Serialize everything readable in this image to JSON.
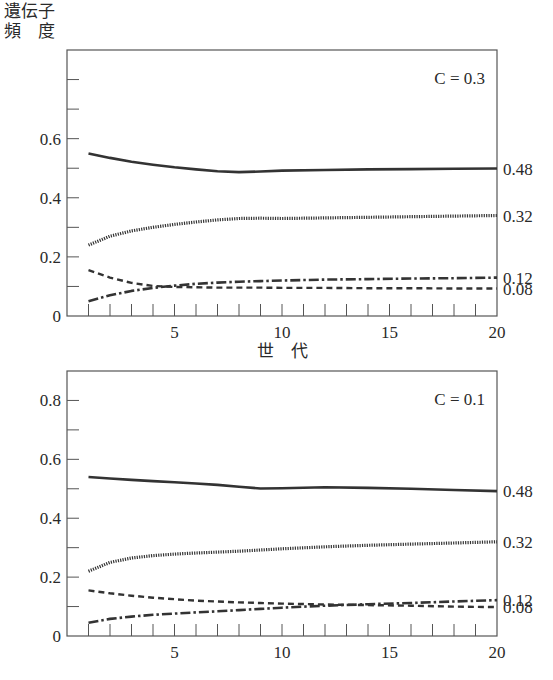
{
  "figure": {
    "ylabel_line1": "遺伝子",
    "ylabel_line2": "頻　度",
    "xlabel": "世　代"
  },
  "chart_data": [
    {
      "type": "line",
      "title": "C = 0.3",
      "xlabel": "世代",
      "ylabel": "遺伝子頻度",
      "xlim": [
        0,
        20
      ],
      "ylim": [
        0,
        0.9
      ],
      "x_ticks": [
        5,
        10,
        15,
        20
      ],
      "y_ticks": [
        0,
        0.2,
        0.4,
        0.6
      ],
      "y_minor_step": 0.1,
      "x_minor_step": 1,
      "grid": false,
      "right_labels": [
        "0.48",
        "0.32",
        "0.12",
        "0.08"
      ],
      "x": [
        1,
        2,
        3,
        4,
        5,
        6,
        7,
        8,
        9,
        10,
        12,
        14,
        16,
        18,
        20
      ],
      "series": [
        {
          "name": "solid",
          "style": "solid",
          "end_label": "0.48",
          "values": [
            0.55,
            0.535,
            0.522,
            0.512,
            0.503,
            0.496,
            0.49,
            0.487,
            0.489,
            0.492,
            0.494,
            0.496,
            0.497,
            0.498,
            0.499
          ]
        },
        {
          "name": "dotted",
          "style": "dotted",
          "end_label": "0.32",
          "values": [
            0.24,
            0.27,
            0.288,
            0.3,
            0.31,
            0.318,
            0.325,
            0.33,
            0.331,
            0.33,
            0.332,
            0.334,
            0.336,
            0.338,
            0.34
          ]
        },
        {
          "name": "dash-dot",
          "style": "dashdot",
          "end_label": "0.12",
          "values": [
            0.05,
            0.07,
            0.085,
            0.095,
            0.103,
            0.109,
            0.113,
            0.116,
            0.118,
            0.12,
            0.123,
            0.125,
            0.127,
            0.128,
            0.13
          ]
        },
        {
          "name": "dashed",
          "style": "dashed",
          "end_label": "0.08",
          "values": [
            0.155,
            0.13,
            0.112,
            0.102,
            0.098,
            0.097,
            0.096,
            0.096,
            0.096,
            0.095,
            0.095,
            0.094,
            0.094,
            0.093,
            0.093
          ]
        }
      ]
    },
    {
      "type": "line",
      "title": "C = 0.1",
      "xlabel": "",
      "ylabel": "遺伝子頻度",
      "xlim": [
        0,
        20
      ],
      "ylim": [
        0,
        0.9
      ],
      "x_ticks": [
        5,
        10,
        15,
        20
      ],
      "y_ticks": [
        0,
        0.2,
        0.4,
        0.6,
        0.8
      ],
      "y_minor_step": 0.1,
      "x_minor_step": 1,
      "grid": false,
      "right_labels": [
        "0.48",
        "0.32",
        "0.12",
        "0.08"
      ],
      "x": [
        1,
        2,
        3,
        4,
        5,
        6,
        7,
        8,
        9,
        10,
        12,
        14,
        16,
        18,
        20
      ],
      "series": [
        {
          "name": "solid",
          "style": "solid",
          "end_label": "0.48",
          "values": [
            0.54,
            0.535,
            0.53,
            0.526,
            0.522,
            0.518,
            0.513,
            0.507,
            0.501,
            0.502,
            0.505,
            0.503,
            0.5,
            0.496,
            0.492
          ]
        },
        {
          "name": "dotted",
          "style": "dotted",
          "end_label": "0.32",
          "values": [
            0.22,
            0.25,
            0.265,
            0.273,
            0.278,
            0.282,
            0.285,
            0.288,
            0.292,
            0.296,
            0.303,
            0.308,
            0.312,
            0.316,
            0.32
          ]
        },
        {
          "name": "dash-dot",
          "style": "dashdot",
          "end_label": "0.12",
          "values": [
            0.045,
            0.058,
            0.066,
            0.072,
            0.076,
            0.08,
            0.084,
            0.088,
            0.092,
            0.096,
            0.103,
            0.108,
            0.112,
            0.117,
            0.122
          ]
        },
        {
          "name": "dashed",
          "style": "dashed",
          "end_label": "0.08",
          "values": [
            0.155,
            0.145,
            0.137,
            0.13,
            0.125,
            0.12,
            0.117,
            0.114,
            0.112,
            0.11,
            0.107,
            0.105,
            0.103,
            0.1,
            0.098
          ]
        }
      ]
    }
  ]
}
